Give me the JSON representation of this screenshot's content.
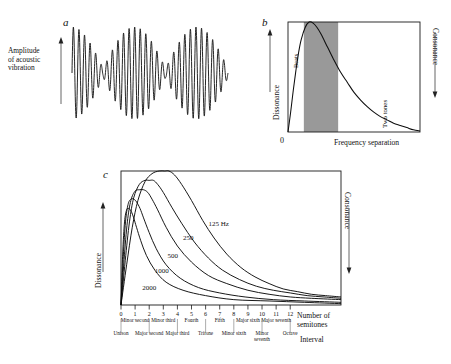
{
  "figure": {
    "panels": [
      {
        "letter": "a"
      },
      {
        "letter": "b"
      },
      {
        "letter": "c"
      }
    ]
  },
  "panel_a": {
    "letter": "a",
    "y_axis_label_lines": [
      "Amplitude",
      "of acoustic",
      "vibration"
    ],
    "y_axis_label": "Amplitude of acoustic vibration"
  },
  "panel_b": {
    "letter": "b",
    "y_axis_label": "Dissonance",
    "y_axis_right_label": "Consonance",
    "x_axis_label": "Frequency separation",
    "origin_label": "0",
    "regions": [
      {
        "name": "Beats",
        "shaded": false
      },
      {
        "name": "Roughness",
        "shaded": true
      },
      {
        "name": "Two tones",
        "shaded": false
      }
    ],
    "shade_color": "#999999"
  },
  "panel_c": {
    "letter": "c",
    "y_axis_label": "Dissonance",
    "y_axis_right_label": "Consonance",
    "x_axis_label_lines": [
      "Number of",
      "semitones"
    ],
    "x_axis_label": "Number of semitones",
    "interval_axis_label": "Interval",
    "semitone_ticks": [
      "0",
      "1",
      "2",
      "3",
      "4",
      "5",
      "6",
      "7",
      "8",
      "9",
      "10",
      "11",
      "12"
    ],
    "interval_names": [
      "Unison",
      "Minor second",
      "Major second",
      "Minor third",
      "Major third",
      "Fourth",
      "Tritone",
      "Fifth",
      "Minor sixth",
      "Major sixth",
      "Minor seventh",
      "Major seventh",
      "Octave"
    ],
    "curve_labels": [
      "125 Hz",
      "250",
      "500",
      "1000",
      "2000"
    ]
  },
  "chart_data": [
    {
      "type": "line",
      "panel": "a",
      "title": "",
      "xlabel": "",
      "ylabel": "Amplitude of acoustic vibration",
      "description": "Amplitude-modulated (beating) acoustic waveform produced by two tones of nearby frequency",
      "carrier_cycles": 28,
      "beat_cycles": 2.5,
      "grid": false,
      "legend": "none"
    },
    {
      "type": "line",
      "panel": "b",
      "title": "",
      "xlabel": "Frequency separation",
      "ylabel": "Dissonance",
      "y2label": "Consonance",
      "xlim": [
        0,
        1
      ],
      "ylim": [
        0,
        1
      ],
      "grid": false,
      "legend": "none",
      "annotations": [
        "Beats",
        "Roughness",
        "Two tones",
        "0"
      ],
      "shaded_region": {
        "label": "Roughness",
        "x_start": 0.12,
        "x_end": 0.38,
        "color": "#999999"
      },
      "x": [
        0.0,
        0.02,
        0.04,
        0.06,
        0.08,
        0.1,
        0.13,
        0.16,
        0.19,
        0.22,
        0.25,
        0.3,
        0.35,
        0.4,
        0.45,
        0.5,
        0.55,
        0.6,
        0.65,
        0.7,
        0.75,
        0.8,
        0.85,
        0.9,
        0.95,
        1.0
      ],
      "values": [
        0.0,
        0.18,
        0.38,
        0.56,
        0.72,
        0.84,
        0.95,
        1.0,
        0.99,
        0.95,
        0.89,
        0.77,
        0.65,
        0.54,
        0.45,
        0.36,
        0.29,
        0.23,
        0.18,
        0.14,
        0.11,
        0.08,
        0.06,
        0.04,
        0.02,
        0.01
      ]
    },
    {
      "type": "line",
      "panel": "c",
      "title": "",
      "xlabel": "Number of semitones",
      "ylabel": "Dissonance",
      "y2label": "Consonance",
      "x2label": "Interval",
      "xlim": [
        0,
        15.6
      ],
      "ylim": [
        0,
        1
      ],
      "grid": false,
      "legend": "inline curve labels",
      "categories": [
        "0",
        "1",
        "2",
        "3",
        "4",
        "5",
        "6",
        "7",
        "8",
        "9",
        "10",
        "11",
        "12"
      ],
      "series": [
        {
          "name": "125 Hz",
          "peak_semitone": 3.4,
          "peak_value": 1.0,
          "x": [
            0.0,
            0.4,
            0.8,
            1.2,
            1.7,
            2.2,
            2.7,
            3.1,
            3.4,
            3.8,
            4.3,
            5.0,
            5.8,
            6.6,
            7.5,
            8.5,
            9.5,
            10.5,
            11.5,
            12.5,
            13.5,
            14.5,
            15.6
          ],
          "values": [
            0.0,
            0.3,
            0.58,
            0.78,
            0.92,
            0.98,
            1.0,
            1.0,
            1.0,
            0.97,
            0.9,
            0.78,
            0.63,
            0.5,
            0.38,
            0.28,
            0.21,
            0.16,
            0.12,
            0.1,
            0.08,
            0.07,
            0.06
          ]
        },
        {
          "name": "250",
          "peak_semitone": 2.3,
          "peak_value": 0.93,
          "x": [
            0.0,
            0.3,
            0.6,
            0.9,
            1.3,
            1.7,
            2.0,
            2.3,
            2.6,
            3.0,
            3.6,
            4.3,
            5.2,
            6.2,
            7.2,
            8.4,
            9.6,
            10.8,
            12.0,
            13.2,
            14.4,
            15.6
          ],
          "values": [
            0.0,
            0.33,
            0.62,
            0.8,
            0.9,
            0.93,
            0.93,
            0.93,
            0.9,
            0.84,
            0.73,
            0.61,
            0.47,
            0.35,
            0.26,
            0.19,
            0.14,
            0.11,
            0.09,
            0.07,
            0.06,
            0.05
          ]
        },
        {
          "name": "500",
          "peak_semitone": 1.6,
          "peak_value": 0.86,
          "x": [
            0.0,
            0.22,
            0.45,
            0.7,
            1.0,
            1.3,
            1.6,
            1.9,
            2.2,
            2.6,
            3.2,
            4.0,
            5.0,
            6.2,
            7.5,
            9.0,
            10.5,
            12.0,
            13.5,
            15.6
          ],
          "values": [
            0.0,
            0.34,
            0.62,
            0.78,
            0.85,
            0.86,
            0.86,
            0.84,
            0.79,
            0.71,
            0.58,
            0.44,
            0.32,
            0.22,
            0.16,
            0.11,
            0.08,
            0.06,
            0.05,
            0.04
          ]
        },
        {
          "name": "1000",
          "peak_semitone": 1.0,
          "peak_value": 0.79,
          "x": [
            0.0,
            0.16,
            0.32,
            0.5,
            0.7,
            0.9,
            1.1,
            1.35,
            1.6,
            2.0,
            2.5,
            3.2,
            4.2,
            5.5,
            7.0,
            8.8,
            10.8,
            13.0,
            15.6
          ],
          "values": [
            0.0,
            0.36,
            0.62,
            0.75,
            0.79,
            0.79,
            0.77,
            0.72,
            0.65,
            0.54,
            0.42,
            0.3,
            0.2,
            0.13,
            0.09,
            0.06,
            0.04,
            0.03,
            0.02
          ]
        },
        {
          "name": "2000",
          "peak_semitone": 0.6,
          "peak_value": 0.72,
          "x": [
            0.0,
            0.12,
            0.25,
            0.4,
            0.55,
            0.72,
            0.9,
            1.1,
            1.4,
            1.8,
            2.4,
            3.2,
            4.4,
            6.0,
            8.0,
            10.5,
            13.0,
            15.6
          ],
          "values": [
            0.0,
            0.38,
            0.62,
            0.71,
            0.72,
            0.7,
            0.65,
            0.58,
            0.48,
            0.37,
            0.26,
            0.17,
            0.11,
            0.07,
            0.04,
            0.03,
            0.02,
            0.01
          ]
        }
      ]
    }
  ]
}
